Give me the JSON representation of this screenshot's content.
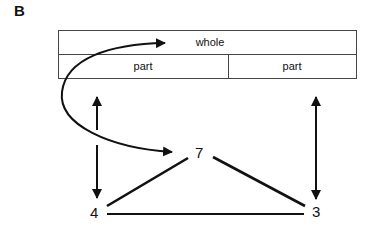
{
  "panel": {
    "label": "B"
  },
  "bar_model": {
    "whole_label": "whole",
    "parts": [
      {
        "label": "part"
      },
      {
        "label": "part"
      }
    ]
  },
  "number_bond": {
    "whole": "7",
    "parts": [
      "4",
      "3"
    ]
  },
  "colors": {
    "line": "#111111",
    "box_border": "#444444"
  }
}
